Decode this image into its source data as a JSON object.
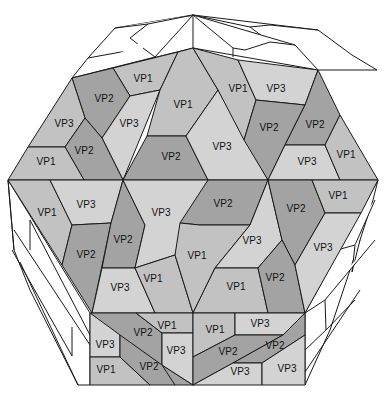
{
  "figure": {
    "colors": {
      "VP1": "#c2c2c2",
      "VP2": "#a3a3a3",
      "VP3": "#d3d3d3",
      "outline": "#1a1a1a",
      "wireframe_fill": "#ffffff"
    },
    "labels": [
      {
        "id": "l1",
        "text": "VP1",
        "x": 143,
        "y": 79
      },
      {
        "id": "l2",
        "text": "VP2",
        "x": 104,
        "y": 99
      },
      {
        "id": "l3",
        "text": "VP3",
        "x": 129,
        "y": 124
      },
      {
        "id": "l4",
        "text": "VP3",
        "x": 64,
        "y": 124
      },
      {
        "id": "l5",
        "text": "VP2",
        "x": 84,
        "y": 151
      },
      {
        "id": "l6",
        "text": "VP1",
        "x": 46,
        "y": 162
      },
      {
        "id": "l7",
        "text": "VP1",
        "x": 183,
        "y": 105
      },
      {
        "id": "l8",
        "text": "VP2",
        "x": 171,
        "y": 157
      },
      {
        "id": "l9",
        "text": "VP3",
        "x": 222,
        "y": 147
      },
      {
        "id": "l10",
        "text": "VP1",
        "x": 238,
        "y": 89
      },
      {
        "id": "l11",
        "text": "VP3",
        "x": 276,
        "y": 89
      },
      {
        "id": "l12",
        "text": "VP2",
        "x": 269,
        "y": 128
      },
      {
        "id": "l13",
        "text": "VP2",
        "x": 315,
        "y": 125
      },
      {
        "id": "l14",
        "text": "VP3",
        "x": 307,
        "y": 162
      },
      {
        "id": "l15",
        "text": "VP1",
        "x": 346,
        "y": 155
      },
      {
        "id": "l16",
        "text": "VP1",
        "x": 47,
        "y": 213
      },
      {
        "id": "l17",
        "text": "VP3",
        "x": 86,
        "y": 205
      },
      {
        "id": "l18",
        "text": "VP2",
        "x": 86,
        "y": 255
      },
      {
        "id": "l19",
        "text": "VP2",
        "x": 123,
        "y": 240
      },
      {
        "id": "l20",
        "text": "VP3",
        "x": 161,
        "y": 213
      },
      {
        "id": "l21",
        "text": "VP3",
        "x": 120,
        "y": 288
      },
      {
        "id": "l22",
        "text": "VP1",
        "x": 153,
        "y": 279
      },
      {
        "id": "l23",
        "text": "VP2",
        "x": 223,
        "y": 204
      },
      {
        "id": "l24",
        "text": "VP1",
        "x": 197,
        "y": 256
      },
      {
        "id": "l25",
        "text": "VP3",
        "x": 252,
        "y": 241
      },
      {
        "id": "l26",
        "text": "VP1",
        "x": 236,
        "y": 287
      },
      {
        "id": "l27",
        "text": "VP2",
        "x": 296,
        "y": 209
      },
      {
        "id": "l28",
        "text": "VP2",
        "x": 275,
        "y": 278
      },
      {
        "id": "l29",
        "text": "VP1",
        "x": 338,
        "y": 196
      },
      {
        "id": "l30",
        "text": "VP3",
        "x": 323,
        "y": 248
      },
      {
        "id": "l31",
        "text": "VP1",
        "x": 167,
        "y": 326
      },
      {
        "id": "l32",
        "text": "VP2",
        "x": 143,
        "y": 333
      },
      {
        "id": "l33",
        "text": "VP3",
        "x": 105,
        "y": 345
      },
      {
        "id": "l34",
        "text": "VP3",
        "x": 176,
        "y": 351
      },
      {
        "id": "l35",
        "text": "VP1",
        "x": 106,
        "y": 370
      },
      {
        "id": "l36",
        "text": "VP2",
        "x": 149,
        "y": 367
      },
      {
        "id": "l37",
        "text": "VP1",
        "x": 215,
        "y": 330
      },
      {
        "id": "l38",
        "text": "VP3",
        "x": 260,
        "y": 324
      },
      {
        "id": "l39",
        "text": "VP2",
        "x": 228,
        "y": 352
      },
      {
        "id": "l40",
        "text": "VP2",
        "x": 275,
        "y": 346
      },
      {
        "id": "l41",
        "text": "VP3",
        "x": 240,
        "y": 372
      },
      {
        "id": "l42",
        "text": "VP3",
        "x": 287,
        "y": 369
      }
    ]
  }
}
